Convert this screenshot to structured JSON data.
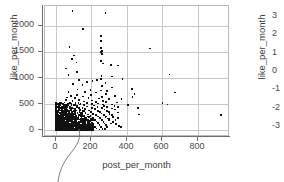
{
  "chart_data": {
    "type": "scatter",
    "title": "",
    "xlabel": "post_per_month",
    "ylabel": "like_per_month",
    "y2label": "like_per_month",
    "xlim": [
      -60,
      980
    ],
    "ylim": [
      -130,
      2380
    ],
    "y2lim": [
      -3.55,
      3.55
    ],
    "xticks": [
      0,
      200,
      400,
      600,
      800
    ],
    "yticks": [
      0,
      500,
      1000,
      1500,
      2000
    ],
    "y2ticks": [
      3,
      2,
      1,
      0,
      -1,
      -2,
      -3
    ],
    "xticklabels": [
      "0",
      "200",
      "400",
      "600",
      "800"
    ],
    "yticklabels": [
      "0",
      "500",
      "1000",
      "1500",
      "2000"
    ],
    "y2ticklabels": [
      "3",
      "2",
      "1",
      "0",
      "-1",
      "-2",
      "-3"
    ],
    "grid": true,
    "grid_color": "#c9c9c9",
    "marker_color": "#111111",
    "marker_size": 1.7,
    "legend": null,
    "annotation_leader_line": true,
    "points": [
      [
        95,
        2290
      ],
      [
        281,
        2245
      ],
      [
        152,
        1945
      ],
      [
        253,
        1800
      ],
      [
        253,
        1705
      ],
      [
        78,
        1600
      ],
      [
        253,
        1570
      ],
      [
        531,
        1565
      ],
      [
        261,
        1520
      ],
      [
        253,
        1505
      ],
      [
        261,
        1455
      ],
      [
        102,
        1430
      ],
      [
        92,
        1370
      ],
      [
        253,
        1320
      ],
      [
        117,
        1300
      ],
      [
        268,
        1280
      ],
      [
        310,
        1255
      ],
      [
        352,
        1240
      ],
      [
        60,
        1185
      ],
      [
        118,
        1115
      ],
      [
        72,
        1060
      ],
      [
        640,
        1070
      ],
      [
        258,
        1040
      ],
      [
        318,
        1030
      ],
      [
        376,
        985
      ],
      [
        254,
        975
      ],
      [
        133,
        965
      ],
      [
        232,
        960
      ],
      [
        207,
        945
      ],
      [
        175,
        930
      ],
      [
        281,
        900
      ],
      [
        96,
        880
      ],
      [
        150,
        860
      ],
      [
        262,
        845
      ],
      [
        318,
        820
      ],
      [
        430,
        790
      ],
      [
        123,
        780
      ],
      [
        196,
        770
      ],
      [
        254,
        760
      ],
      [
        290,
        745
      ],
      [
        72,
        735
      ],
      [
        164,
        728
      ],
      [
        225,
        720
      ],
      [
        672,
        720
      ],
      [
        443,
        700
      ],
      [
        283,
        690
      ],
      [
        118,
        680
      ],
      [
        200,
        672
      ],
      [
        334,
        660
      ],
      [
        88,
        650
      ],
      [
        152,
        645
      ],
      [
        262,
        640
      ],
      [
        432,
        635
      ],
      [
        64,
        628
      ],
      [
        110,
        620
      ],
      [
        185,
        615
      ],
      [
        243,
        610
      ],
      [
        300,
        600
      ],
      [
        370,
        592
      ],
      [
        57,
        585
      ],
      [
        133,
        578
      ],
      [
        205,
        572
      ],
      [
        268,
        566
      ],
      [
        94,
        558
      ],
      [
        160,
        552
      ],
      [
        228,
        546
      ],
      [
        600,
        525
      ],
      [
        283,
        540
      ],
      [
        345,
        532
      ],
      [
        50,
        528
      ],
      [
        112,
        522
      ],
      [
        175,
        516
      ],
      [
        238,
        512
      ],
      [
        71,
        506
      ],
      [
        140,
        502
      ],
      [
        203,
        498
      ],
      [
        265,
        494
      ],
      [
        318,
        490
      ],
      [
        408,
        480
      ],
      [
        628,
        495
      ],
      [
        462,
        428
      ],
      [
        45,
        488
      ],
      [
        100,
        482
      ],
      [
        158,
        478
      ],
      [
        215,
        474
      ],
      [
        272,
        470
      ],
      [
        330,
        466
      ],
      [
        62,
        462
      ],
      [
        120,
        458
      ],
      [
        178,
        454
      ],
      [
        236,
        450
      ],
      [
        290,
        446
      ],
      [
        352,
        442
      ],
      [
        40,
        438
      ],
      [
        95,
        434
      ],
      [
        150,
        430
      ],
      [
        205,
        426
      ],
      [
        260,
        422
      ],
      [
        315,
        418
      ],
      [
        55,
        414
      ],
      [
        110,
        410
      ],
      [
        165,
        406
      ],
      [
        220,
        402
      ],
      [
        275,
        398
      ],
      [
        335,
        394
      ],
      [
        930,
        295
      ],
      [
        470,
        300
      ],
      [
        38,
        390
      ],
      [
        88,
        386
      ],
      [
        138,
        382
      ],
      [
        188,
        378
      ],
      [
        238,
        374
      ],
      [
        288,
        370
      ],
      [
        50,
        366
      ],
      [
        100,
        362
      ],
      [
        150,
        358
      ],
      [
        200,
        354
      ],
      [
        250,
        350
      ],
      [
        300,
        346
      ],
      [
        350,
        342
      ],
      [
        33,
        338
      ],
      [
        78,
        334
      ],
      [
        123,
        330
      ],
      [
        168,
        326
      ],
      [
        213,
        322
      ],
      [
        258,
        318
      ],
      [
        303,
        314
      ],
      [
        45,
        310
      ],
      [
        90,
        306
      ],
      [
        135,
        302
      ],
      [
        180,
        298
      ],
      [
        225,
        294
      ],
      [
        270,
        290
      ],
      [
        315,
        286
      ],
      [
        28,
        282
      ],
      [
        70,
        278
      ],
      [
        112,
        274
      ],
      [
        154,
        270
      ],
      [
        196,
        266
      ],
      [
        238,
        262
      ],
      [
        280,
        258
      ],
      [
        322,
        254
      ],
      [
        40,
        250
      ],
      [
        82,
        246
      ],
      [
        124,
        242
      ],
      [
        166,
        238
      ],
      [
        208,
        234
      ],
      [
        250,
        230
      ],
      [
        292,
        226
      ],
      [
        25,
        222
      ],
      [
        64,
        218
      ],
      [
        103,
        214
      ],
      [
        142,
        210
      ],
      [
        181,
        206
      ],
      [
        220,
        202
      ],
      [
        259,
        198
      ],
      [
        298,
        194
      ],
      [
        337,
        190
      ],
      [
        35,
        186
      ],
      [
        74,
        182
      ],
      [
        113,
        178
      ],
      [
        152,
        174
      ],
      [
        191,
        170
      ],
      [
        230,
        166
      ],
      [
        269,
        162
      ],
      [
        22,
        158
      ],
      [
        58,
        154
      ],
      [
        94,
        150
      ],
      [
        130,
        146
      ],
      [
        166,
        142
      ],
      [
        202,
        138
      ],
      [
        238,
        134
      ],
      [
        274,
        130
      ],
      [
        310,
        126
      ],
      [
        30,
        122
      ],
      [
        66,
        118
      ],
      [
        102,
        114
      ],
      [
        138,
        110
      ],
      [
        174,
        106
      ],
      [
        210,
        102
      ],
      [
        246,
        98
      ],
      [
        282,
        94
      ],
      [
        18,
        90
      ],
      [
        52,
        86
      ],
      [
        86,
        82
      ],
      [
        120,
        78
      ],
      [
        154,
        74
      ],
      [
        188,
        70
      ],
      [
        222,
        66
      ],
      [
        256,
        62
      ],
      [
        290,
        58
      ],
      [
        26,
        54
      ],
      [
        60,
        50
      ],
      [
        94,
        46
      ],
      [
        128,
        42
      ],
      [
        162,
        38
      ],
      [
        196,
        34
      ],
      [
        230,
        30
      ],
      [
        264,
        26
      ],
      [
        15,
        22
      ],
      [
        48,
        18
      ],
      [
        81,
        14
      ],
      [
        114,
        10
      ],
      [
        147,
        8
      ],
      [
        180,
        6
      ],
      [
        213,
        12
      ],
      [
        246,
        16
      ],
      [
        279,
        20
      ],
      [
        340,
        120
      ],
      [
        355,
        85
      ],
      [
        368,
        55
      ],
      [
        322,
        160
      ],
      [
        300,
        210
      ],
      [
        286,
        265
      ],
      [
        350,
        230
      ]
    ],
    "dense_cluster": {
      "description": "Large dense black mass of overlapping points concentrated near the origin",
      "x_range": [
        0,
        210
      ],
      "y_range": [
        0,
        520
      ],
      "count_approx": 1400
    }
  },
  "axes": {
    "left_title": "like_per_month",
    "right_title": "like_per_month",
    "bottom_title": "post_per_month"
  }
}
